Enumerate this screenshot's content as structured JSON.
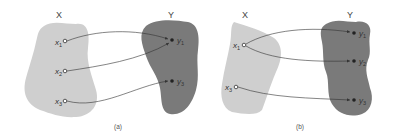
{
  "figure": {
    "colors": {
      "domain_fill": "#cfcfcf",
      "codomain_fill": "#7a7a7a",
      "arrow": "#333333",
      "background": "#ffffff"
    },
    "panels": [
      {
        "caption": "(a)",
        "domain_label": "X",
        "codomain_label": "Y",
        "domain_points": [
          {
            "name": "x",
            "sub": "1"
          },
          {
            "name": "x",
            "sub": "2"
          },
          {
            "name": "x",
            "sub": "3"
          }
        ],
        "codomain_points": [
          {
            "name": "y",
            "sub": "1"
          },
          {
            "name": "y",
            "sub": "3"
          }
        ],
        "mappings": [
          "x1 → y1",
          "x2 → y1",
          "x3 → y3"
        ]
      },
      {
        "caption": "(b)",
        "domain_label": "X",
        "codomain_label": "Y",
        "domain_points": [
          {
            "name": "x",
            "sub": "1"
          },
          {
            "name": "x",
            "sub": "3"
          }
        ],
        "codomain_points": [
          {
            "name": "y",
            "sub": "1"
          },
          {
            "name": "y",
            "sub": "2"
          },
          {
            "name": "y",
            "sub": "3"
          }
        ],
        "mappings": [
          "x1 → y1",
          "x1 → y2",
          "x3 → y3"
        ]
      }
    ]
  }
}
